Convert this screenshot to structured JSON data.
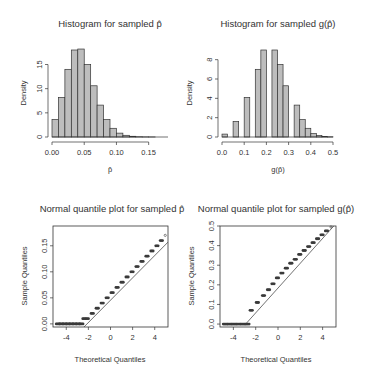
{
  "chart_data": [
    {
      "type": "bar",
      "subtype": "histogram",
      "title": "Histogram for sampled p̂",
      "xlabel": "p̂",
      "ylabel": "Density",
      "xlim": [
        0,
        0.18
      ],
      "ylim": [
        0,
        18
      ],
      "xticks": [
        0.0,
        0.05,
        0.1,
        0.15
      ],
      "xtick_labels": [
        "0.00",
        "0.05",
        "0.10",
        "0.15"
      ],
      "yticks": [
        0,
        5,
        10,
        15
      ],
      "ytick_labels": [
        "0",
        "5",
        "10",
        "15"
      ],
      "bin_width": 0.01,
      "bin_starts": [
        0.0,
        0.01,
        0.02,
        0.03,
        0.04,
        0.05,
        0.06,
        0.07,
        0.08,
        0.09,
        0.1,
        0.11,
        0.12,
        0.13,
        0.14,
        0.15,
        0.16,
        0.17
      ],
      "values": [
        3.6,
        8.2,
        14.0,
        18.0,
        18.2,
        15.0,
        10.6,
        6.6,
        3.6,
        1.8,
        0.8,
        0.35,
        0.15,
        0.05,
        0.02,
        0.01,
        0.0,
        0.0
      ],
      "bar_color": "#bdbdbd",
      "grid": false,
      "legend": null
    },
    {
      "type": "bar",
      "subtype": "histogram",
      "title": "Histogram for sampled g(p̂)",
      "xlabel": "g(p̂)",
      "ylabel": "Density",
      "xlim": [
        0,
        0.5
      ],
      "ylim": [
        0,
        9
      ],
      "xticks": [
        0.0,
        0.1,
        0.2,
        0.3,
        0.4,
        0.5
      ],
      "xtick_labels": [
        "0.0",
        "0.1",
        "0.2",
        "0.3",
        "0.4",
        "0.5"
      ],
      "yticks": [
        0,
        2,
        4,
        6,
        8
      ],
      "ytick_labels": [
        "0",
        "2",
        "4",
        "6",
        "8"
      ],
      "bin_width": 0.025,
      "bin_starts": [
        0.0,
        0.025,
        0.05,
        0.075,
        0.1,
        0.125,
        0.15,
        0.175,
        0.2,
        0.225,
        0.25,
        0.275,
        0.3,
        0.325,
        0.35,
        0.375,
        0.4,
        0.425,
        0.45,
        0.475
      ],
      "values": [
        0.3,
        0.0,
        1.6,
        0.0,
        4.1,
        0.0,
        7.0,
        9.0,
        0.0,
        9.0,
        7.5,
        5.3,
        0.0,
        3.3,
        1.8,
        0.9,
        0.35,
        0.15,
        0.05,
        0.02
      ],
      "bar_color": "#bdbdbd",
      "grid": false,
      "legend": null
    },
    {
      "type": "scatter",
      "subtype": "qq-plot",
      "title": "Normal quantile plot for sampled p̂",
      "xlabel": "Theoretical Quantiles",
      "ylabel": "Sample Quantiles",
      "xlim": [
        -5.2,
        5.2
      ],
      "ylim": [
        -0.006,
        0.188
      ],
      "xticks": [
        -4,
        -2,
        0,
        2,
        4
      ],
      "xtick_labels": [
        "-4",
        "-2",
        "0",
        "2",
        "4"
      ],
      "yticks": [
        0.0,
        0.05,
        0.1,
        0.15
      ],
      "ytick_labels": [
        "0.00",
        "0.05",
        "0.10",
        "0.15"
      ],
      "points_x": [
        -4.8,
        -4.5,
        -4.2,
        -3.9,
        -3.6,
        -3.3,
        -3.0,
        -2.7,
        -2.4,
        -2.1,
        -1.65,
        -1.2,
        -0.75,
        -0.3,
        0.15,
        0.6,
        1.05,
        1.5,
        1.95,
        2.4,
        2.85,
        3.3,
        3.75,
        4.2,
        4.6,
        4.95
      ],
      "points_y": [
        0.0,
        0.0,
        0.0,
        0.0,
        0.0,
        0.0,
        0.0,
        0.0,
        0.01,
        0.01,
        0.02,
        0.03,
        0.04,
        0.05,
        0.06,
        0.07,
        0.08,
        0.09,
        0.1,
        0.11,
        0.12,
        0.13,
        0.14,
        0.15,
        0.16,
        0.17
      ],
      "reference_line": {
        "x": [
          -2.4,
          5.2
        ],
        "y": [
          -0.006,
          0.157
        ]
      },
      "grid": false,
      "legend": null
    },
    {
      "type": "scatter",
      "subtype": "qq-plot",
      "title": "Normal quantile plot for sampled g(p̂)",
      "xlabel": "Theoretical Quantiles",
      "ylabel": "Sample Quantiles",
      "xlim": [
        -5.2,
        5.2
      ],
      "ylim": [
        -0.015,
        0.5
      ],
      "xticks": [
        -4,
        -2,
        0,
        2,
        4
      ],
      "xtick_labels": [
        "-4",
        "-2",
        "0",
        "2",
        "4"
      ],
      "yticks": [
        0.0,
        0.1,
        0.2,
        0.3,
        0.4,
        0.5
      ],
      "ytick_labels": [
        "0.0",
        "0.1",
        "0.2",
        "0.3",
        "0.4",
        "0.5"
      ],
      "points_x": [
        -4.8,
        -4.4,
        -4.0,
        -3.6,
        -3.2,
        -2.8,
        -2.4,
        -1.85,
        -1.3,
        -0.85,
        -0.45,
        -0.05,
        0.35,
        0.75,
        1.15,
        1.55,
        1.95,
        2.35,
        2.75,
        3.15,
        3.55,
        3.95,
        4.35,
        4.75
      ],
      "points_y": [
        0.0,
        0.0,
        0.0,
        0.0,
        0.0,
        0.0,
        0.07,
        0.11,
        0.145,
        0.175,
        0.205,
        0.235,
        0.26,
        0.285,
        0.31,
        0.33,
        0.355,
        0.375,
        0.395,
        0.415,
        0.435,
        0.455,
        0.475,
        0.495
      ],
      "reference_line": {
        "x": [
          -2.9,
          5.0
        ],
        "y": [
          0.0,
          0.5
        ]
      },
      "grid": false,
      "legend": null
    }
  ],
  "panels": [
    {
      "box": {
        "x0": 52,
        "x1": 168,
        "y0": 50,
        "y1": 137
      },
      "frame": false,
      "ylabel_x": 24,
      "title_y": 27
    },
    {
      "box": {
        "x0": 222,
        "x1": 333,
        "y0": 50,
        "y1": 137
      },
      "frame": false,
      "ylabel_x": 192,
      "title_y": 27
    },
    {
      "box": {
        "x0": 53,
        "x1": 168,
        "y0": 226,
        "y1": 327
      },
      "frame": true,
      "ylabel_x": 25,
      "title_y": 210
    },
    {
      "box": {
        "x0": 220,
        "x1": 336,
        "y0": 226,
        "y1": 327
      },
      "frame": true,
      "ylabel_x": 193,
      "title_y": 210
    }
  ],
  "colors": {
    "bar_fill": "#bdbdbd",
    "stroke": "#333333",
    "point": "#3a3a3a",
    "background": "#ffffff"
  }
}
